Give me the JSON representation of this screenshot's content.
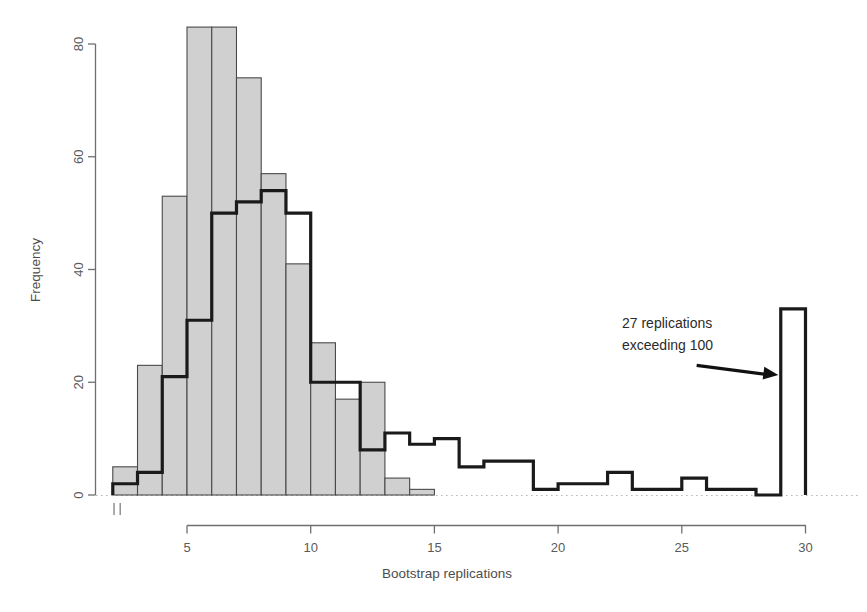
{
  "chart_data": {
    "type": "bar",
    "title": "",
    "subtitle": "",
    "xlabel": "Bootstrap replications",
    "ylabel": "Frequency",
    "xlim": [
      2.0,
      30.4
    ],
    "ylim": [
      0,
      88
    ],
    "grid": false,
    "legend": null,
    "x_ticks": [
      5,
      10,
      15,
      20,
      25,
      30
    ],
    "x_tick_labels": [
      "5",
      "10",
      "15",
      "20",
      "25",
      "30"
    ],
    "y_ticks": [
      0,
      20,
      40,
      60,
      80
    ],
    "y_tick_labels": [
      "0",
      "20",
      "40",
      "60",
      "80"
    ],
    "bin_width": 1,
    "series": [
      {
        "name": "shaded-histogram",
        "style": "filled",
        "fill_color": "#d0d0d0",
        "edge_color": "#4a4a4a",
        "bin_starts": [
          2,
          3,
          4,
          5,
          6,
          7,
          8,
          9,
          10,
          11,
          12,
          13,
          14
        ],
        "values": [
          5,
          23,
          53,
          83,
          83,
          74,
          57,
          41,
          27,
          17,
          20,
          3,
          1
        ]
      },
      {
        "name": "outline-histogram",
        "style": "step-outline",
        "fill_color": "none",
        "edge_color": "#1a1a1a",
        "bin_starts": [
          2,
          3,
          4,
          5,
          6,
          7,
          8,
          9,
          10,
          11,
          12,
          13,
          14,
          15,
          16,
          17,
          18,
          19,
          20,
          21,
          22,
          23,
          24,
          25,
          26,
          27,
          28,
          29
        ],
        "values": [
          2,
          4,
          21,
          31,
          50,
          52,
          54,
          50,
          20,
          20,
          8,
          11,
          9,
          10,
          5,
          6,
          6,
          1,
          2,
          2,
          4,
          1,
          1,
          3,
          1,
          1,
          0,
          33
        ]
      }
    ],
    "rug_marks": [
      2.05,
      2.3
    ],
    "annotations": [
      {
        "name": "exceeding-note",
        "line1": "27 replications",
        "line2": "exceeding 100",
        "arrow": true,
        "arrow_from_x": 25.6,
        "arrow_from_y": 23,
        "arrow_to_x": 28.9,
        "arrow_to_y": 21
      }
    ]
  },
  "axes": {
    "y_axis_label": "Frequency",
    "x_axis_label": "Bootstrap replications"
  }
}
